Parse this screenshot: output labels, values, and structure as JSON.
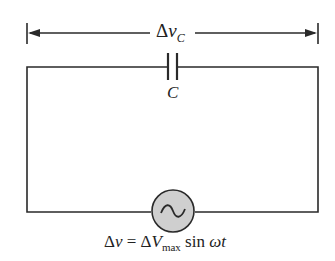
{
  "diagram": {
    "voltage_label": {
      "delta": "Δ",
      "var": "v",
      "sub": "C"
    },
    "capacitor_label": "C",
    "source_equation": {
      "lhs_delta": "Δ",
      "lhs_var": "v",
      "equals": " = Δ",
      "amp_var": "V",
      "amp_sub": "max",
      "func": " sin ",
      "omega": "ωt"
    },
    "source_icon": "ac-source-icon",
    "colors": {
      "line": "#2a2a2a",
      "source_fill": "#cfcfcf"
    }
  }
}
